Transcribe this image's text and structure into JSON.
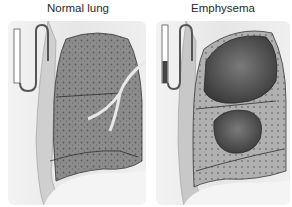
{
  "panels": [
    {
      "title": "Normal lung",
      "type": "normal-lung-illustration"
    },
    {
      "title": "Emphysema",
      "type": "emphysema-lung-illustration"
    }
  ],
  "colors": {
    "tissue": "#8a8a8a",
    "dark_tissue": "#4a4a4a",
    "background": "#ececec"
  }
}
